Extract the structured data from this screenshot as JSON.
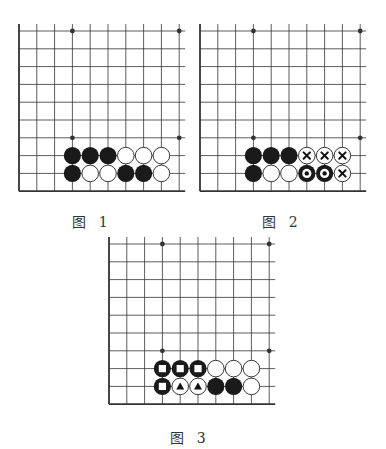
{
  "figure": {
    "background": "#ffffff",
    "line_color": "#333333",
    "stone_black": "#1a1a1a",
    "stone_white": "#ffffff",
    "grid": {
      "columns": 10,
      "rows": 10,
      "spacing": 17.8,
      "open_edges": [
        "top",
        "right"
      ],
      "board_edges": [
        "left",
        "bottom"
      ]
    },
    "star_points": [
      [
        3,
        0
      ],
      [
        9,
        0
      ],
      [
        3,
        6
      ],
      [
        9,
        6
      ]
    ]
  },
  "diagrams": [
    {
      "id": "fig1",
      "caption": "图 1",
      "origin": [
        19,
        31
      ],
      "caption_pos": [
        92,
        220
      ],
      "stones": [
        {
          "col": 3,
          "row": 7,
          "color": "black",
          "mark": null
        },
        {
          "col": 4,
          "row": 7,
          "color": "black",
          "mark": null
        },
        {
          "col": 5,
          "row": 7,
          "color": "black",
          "mark": null
        },
        {
          "col": 6,
          "row": 7,
          "color": "white",
          "mark": null
        },
        {
          "col": 7,
          "row": 7,
          "color": "white",
          "mark": null
        },
        {
          "col": 8,
          "row": 7,
          "color": "white",
          "mark": null
        },
        {
          "col": 3,
          "row": 8,
          "color": "black",
          "mark": null
        },
        {
          "col": 4,
          "row": 8,
          "color": "white",
          "mark": null
        },
        {
          "col": 5,
          "row": 8,
          "color": "white",
          "mark": null
        },
        {
          "col": 6,
          "row": 8,
          "color": "black",
          "mark": null
        },
        {
          "col": 7,
          "row": 8,
          "color": "black",
          "mark": null
        },
        {
          "col": 8,
          "row": 8,
          "color": "white",
          "mark": null
        }
      ]
    },
    {
      "id": "fig2",
      "caption": "图 2",
      "origin": [
        200,
        31
      ],
      "caption_pos": [
        282,
        220
      ],
      "stones": [
        {
          "col": 3,
          "row": 7,
          "color": "black",
          "mark": null
        },
        {
          "col": 4,
          "row": 7,
          "color": "black",
          "mark": null
        },
        {
          "col": 5,
          "row": 7,
          "color": "black",
          "mark": null
        },
        {
          "col": 6,
          "row": 7,
          "color": "white",
          "mark": "cross"
        },
        {
          "col": 7,
          "row": 7,
          "color": "white",
          "mark": "cross"
        },
        {
          "col": 8,
          "row": 7,
          "color": "white",
          "mark": "cross"
        },
        {
          "col": 3,
          "row": 8,
          "color": "black",
          "mark": null
        },
        {
          "col": 4,
          "row": 8,
          "color": "white",
          "mark": null
        },
        {
          "col": 5,
          "row": 8,
          "color": "white",
          "mark": null
        },
        {
          "col": 6,
          "row": 8,
          "color": "black",
          "mark": "circle"
        },
        {
          "col": 7,
          "row": 8,
          "color": "black",
          "mark": "circle"
        },
        {
          "col": 8,
          "row": 8,
          "color": "white",
          "mark": "cross"
        }
      ]
    },
    {
      "id": "fig3",
      "caption": "图 3",
      "origin": [
        109,
        244
      ],
      "caption_pos": [
        190,
        436
      ],
      "stones": [
        {
          "col": 3,
          "row": 7,
          "color": "black",
          "mark": "square"
        },
        {
          "col": 4,
          "row": 7,
          "color": "black",
          "mark": "square"
        },
        {
          "col": 5,
          "row": 7,
          "color": "black",
          "mark": "square"
        },
        {
          "col": 6,
          "row": 7,
          "color": "white",
          "mark": null
        },
        {
          "col": 7,
          "row": 7,
          "color": "white",
          "mark": null
        },
        {
          "col": 8,
          "row": 7,
          "color": "white",
          "mark": null
        },
        {
          "col": 3,
          "row": 8,
          "color": "black",
          "mark": "square"
        },
        {
          "col": 4,
          "row": 8,
          "color": "white",
          "mark": "triangle"
        },
        {
          "col": 5,
          "row": 8,
          "color": "white",
          "mark": "triangle"
        },
        {
          "col": 6,
          "row": 8,
          "color": "black",
          "mark": null
        },
        {
          "col": 7,
          "row": 8,
          "color": "black",
          "mark": null
        },
        {
          "col": 8,
          "row": 8,
          "color": "white",
          "mark": null
        }
      ]
    }
  ]
}
